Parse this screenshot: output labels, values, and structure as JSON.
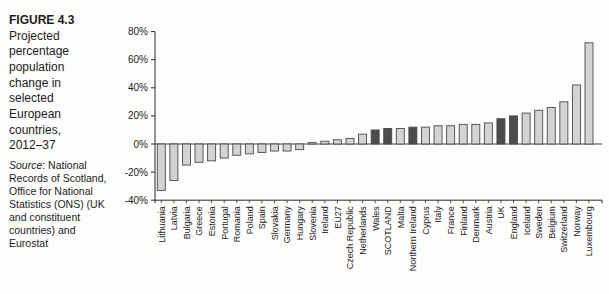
{
  "figure": {
    "label": "FIGURE 4.3",
    "title": "Projected percentage population change in selected European countries, 2012–37",
    "source_word": "Source",
    "source_rest": ": National Records of Scotland, Office for National Statistics (ONS) (UK and constituent countries) and Eurostat"
  },
  "colors": {
    "bar_light": "#d3d3d3",
    "bar_dark": "#4c4c4c",
    "bar_outline": "#4a4a4a",
    "axis": "#2b2b2b",
    "text": "#1c1c1c"
  },
  "chart_data": {
    "type": "bar",
    "title": "",
    "xlabel": "",
    "ylabel": "",
    "ylim": [
      -40,
      80
    ],
    "ytick_step": 20,
    "ytick_labels": [
      "80%",
      "60%",
      "40%",
      "20%",
      "0%",
      "-20%",
      "-40%"
    ],
    "grid": false,
    "legend": null,
    "categories": [
      "Lithuania",
      "Latvia",
      "Bulgaria",
      "Greece",
      "Estonia",
      "Portugal",
      "Romania",
      "Poland",
      "Spain",
      "Slovakia",
      "Germany",
      "Hungary",
      "Slovenia",
      "Ireland",
      "EU27",
      "Czech Republic",
      "Netherlands",
      "Wales",
      "SCOTLAND",
      "Malta",
      "Northern Ireland",
      "Cyprus",
      "Italy",
      "France",
      "Finland",
      "Denmark",
      "Austria",
      "UK",
      "England",
      "Iceland",
      "Sweden",
      "Belgium",
      "Switzerland",
      "Norway",
      "Luxembourg"
    ],
    "values": [
      -33,
      -26,
      -15,
      -13,
      -12,
      -10,
      -8,
      -7,
      -6,
      -5,
      -5,
      -4,
      1,
      2,
      3,
      4,
      7,
      10,
      11,
      11,
      12,
      12,
      13,
      13,
      14,
      14,
      15,
      18,
      20,
      22,
      24,
      26,
      30,
      42,
      72
    ],
    "highlighted_categories": [
      "Wales",
      "SCOTLAND",
      "Northern Ireland",
      "UK",
      "England"
    ]
  }
}
